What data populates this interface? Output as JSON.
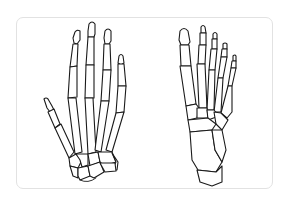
{
  "illustration": {
    "subject": "skeleton of human hand and foot",
    "panels": [
      {
        "id": "hand",
        "label": "hand-skeleton"
      },
      {
        "id": "foot",
        "label": "foot-skeleton"
      }
    ],
    "colors": {
      "background": "#ffffff",
      "frame_border": "#e2e2e2",
      "line": "#1a1a1a"
    }
  }
}
